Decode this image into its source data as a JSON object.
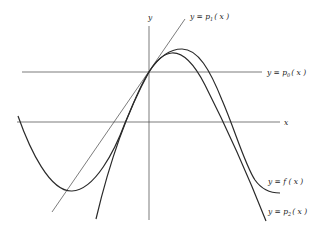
{
  "diagram": {
    "type": "function-approximation-plot",
    "axes": {
      "x_label": "x",
      "y_label": "y"
    },
    "curves": [
      {
        "id": "f",
        "label": "y = f(x)",
        "kind": "oscillating curve"
      },
      {
        "id": "p0",
        "label": "y = p0(x)",
        "kind": "horizontal line (constant approximation)"
      },
      {
        "id": "p1",
        "label": "y = p1(x)",
        "kind": "tangent line (linear approximation)"
      },
      {
        "id": "p2",
        "label": "y = p2(x)",
        "kind": "parabola (quadratic approximation)"
      }
    ],
    "labels": {
      "y_axis": "y",
      "x_axis": "x",
      "p1": {
        "pre": "y = p",
        "sub": "1",
        "post": "( x )"
      },
      "p0": {
        "pre": "y = p",
        "sub": "0",
        "post": "( x )"
      },
      "f": "y = f ( x )",
      "p2": {
        "pre": "y = p",
        "sub": "2",
        "post": "( x )"
      }
    },
    "colors": {
      "stroke": "#2a2a2a",
      "background": "#ffffff"
    }
  }
}
